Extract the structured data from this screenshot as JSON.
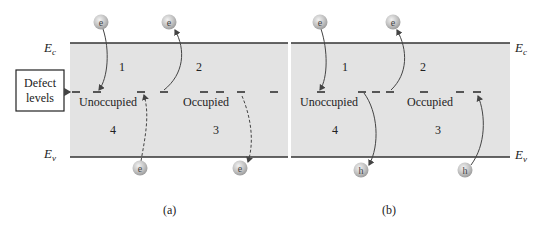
{
  "labels": {
    "ec_main": "E",
    "ec_sub": "c",
    "ev_main": "E",
    "ev_sub": "v",
    "defect_line1": "Defect",
    "defect_line2": "levels"
  },
  "panel_a": {
    "caption": "(a)",
    "regions": [
      "1",
      "2",
      "3",
      "4"
    ],
    "unoccupied": "Unoccupied",
    "occupied": "Occupied",
    "top_particles": [
      "e",
      "e"
    ],
    "bottom_particles": [
      "e",
      "e"
    ]
  },
  "panel_b": {
    "caption": "(b)",
    "regions": [
      "1",
      "2",
      "3",
      "4"
    ],
    "unoccupied": "Unoccupied",
    "occupied": "Occupied",
    "top_particles": [
      "e",
      "e"
    ],
    "bottom_particles": [
      "h",
      "h"
    ]
  },
  "colors": {
    "band_fill": "#e3e3e3",
    "band_line": "#333333",
    "particle_fill": "#bdbdbd",
    "arrow": "#333333"
  }
}
